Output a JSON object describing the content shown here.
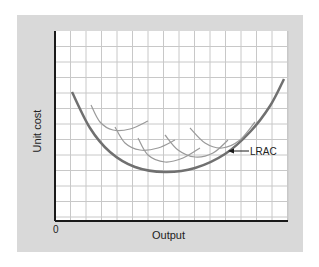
{
  "chart_data": {
    "type": "line",
    "title": "",
    "xlabel": "Output",
    "ylabel": "Unit cost",
    "origin_label": "0",
    "grid": true,
    "legend": null,
    "annotations": [
      {
        "text": "LRAC",
        "arrow_to": "LRAC curve",
        "position": "right of curve near lower right"
      }
    ],
    "series": [
      {
        "name": "LRAC",
        "role": "long-run average cost (envelope)",
        "points_px": [
          [
            72,
            92
          ],
          [
            90,
            128
          ],
          [
            110,
            152
          ],
          [
            135,
            167
          ],
          [
            165,
            172
          ],
          [
            195,
            168
          ],
          [
            225,
            154
          ],
          [
            250,
            132
          ],
          [
            270,
            106
          ],
          [
            284,
            79
          ]
        ]
      },
      {
        "name": "SRAC1",
        "points_px": [
          [
            91,
            105
          ],
          [
            100,
            122
          ],
          [
            113,
            130
          ],
          [
            130,
            129
          ],
          [
            148,
            121
          ]
        ]
      },
      {
        "name": "SRAC2",
        "points_px": [
          [
            115,
            127
          ],
          [
            125,
            143
          ],
          [
            140,
            150
          ],
          [
            158,
            148
          ],
          [
            175,
            140
          ]
        ]
      },
      {
        "name": "SRAC3",
        "points_px": [
          [
            138,
            138
          ],
          [
            148,
            155
          ],
          [
            165,
            162
          ],
          [
            183,
            158
          ],
          [
            200,
            148
          ]
        ]
      },
      {
        "name": "SRAC4",
        "points_px": [
          [
            165,
            135
          ],
          [
            178,
            150
          ],
          [
            195,
            157
          ],
          [
            213,
            153
          ],
          [
            228,
            140
          ]
        ]
      },
      {
        "name": "SRAC5",
        "points_px": [
          [
            190,
            128
          ],
          [
            205,
            143
          ],
          [
            222,
            148
          ],
          [
            240,
            140
          ],
          [
            255,
            122
          ]
        ]
      }
    ]
  },
  "labels": {
    "y_axis": "Unit cost",
    "x_axis": "Output",
    "origin": "0",
    "lrac": "LRAC"
  },
  "colors": {
    "panel": "#d9d9d9",
    "plot_bg": "#ffffff",
    "grid": "#c8c8c8",
    "axis": "#1a1a1a",
    "lrac": "#707070",
    "srac": "#9a9a9a"
  }
}
